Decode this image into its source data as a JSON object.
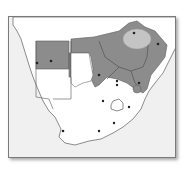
{
  "map": {
    "title": "",
    "region": "Southern Africa",
    "colors": {
      "background": "#ffffff",
      "sea": "#f2f2f2",
      "land": "#ffffff",
      "shaded_region": "#8c8c8c",
      "highlight_region": "#c4c4c4",
      "border": "#6e6e6e",
      "city_dot": "#222222"
    },
    "legend": []
  }
}
